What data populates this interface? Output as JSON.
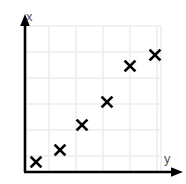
{
  "chart_data": {
    "type": "scatter",
    "title": "",
    "xlabel": "y",
    "ylabel": "x",
    "grid": true,
    "legend": null,
    "marker": "x",
    "marker_color": "#000000",
    "axis_color": "#000000",
    "grid_color": "#ececed",
    "label_color": "#555558",
    "xlim": [
      0,
      6.5
    ],
    "ylim": [
      0,
      6.5
    ],
    "x_tick_labels": [],
    "y_tick_labels": [],
    "points": [
      {
        "x": 0.45,
        "y": 0.65
      },
      {
        "x": 1.3,
        "y": 1.45
      },
      {
        "x": 2.1,
        "y": 2.4
      },
      {
        "x": 2.95,
        "y": 3.35
      },
      {
        "x": 4.1,
        "y": 5.0
      },
      {
        "x": 4.95,
        "y": 5.7
      }
    ],
    "pixel_points": [
      {
        "px": 36,
        "py": 162
      },
      {
        "px": 60,
        "py": 150
      },
      {
        "px": 82,
        "py": 125
      },
      {
        "px": 107,
        "py": 102
      },
      {
        "px": 130,
        "py": 66
      },
      {
        "px": 155,
        "py": 55
      }
    ],
    "vertical_gridlines_px": [
      49,
      76,
      103,
      130,
      157
    ],
    "horizontal_gridlines_px": [
      52,
      78,
      104,
      130,
      156
    ],
    "plot_area_px": {
      "left": 25,
      "right": 161,
      "top": 26,
      "bottom": 172
    }
  },
  "axes": {
    "x_axis_label": "x",
    "y_axis_label": "y",
    "vertical_axis_name": "vertical-axis",
    "horizontal_axis_name": "horizontal-axis"
  },
  "markers": {
    "glyph": "✕"
  }
}
